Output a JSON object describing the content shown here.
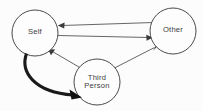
{
  "diagram": {
    "background_color": "#fcfcfc",
    "node_stroke_color": "#4a4a4a",
    "thin_edge_color": "#555555",
    "thick_edge_color": "#1a1a1a",
    "nodes": [
      {
        "id": "self",
        "label": "Self",
        "label_lines": [
          "Self"
        ],
        "cx": 35,
        "cy": 33,
        "r": 23
      },
      {
        "id": "other",
        "label": "Other",
        "label_lines": [
          "Other"
        ],
        "cx": 173,
        "cy": 31,
        "r": 23
      },
      {
        "id": "third_person",
        "label": "Third Person",
        "label_lines": [
          "Third",
          "Person"
        ],
        "cx": 97,
        "cy": 82,
        "r": 23
      }
    ],
    "edges": [
      {
        "id": "other-to-self",
        "from": "other",
        "to": "self",
        "style": "thin",
        "shape": "straight",
        "arrowhead_at": "self"
      },
      {
        "id": "self-to-other",
        "from": "self",
        "to": "other",
        "style": "thin",
        "shape": "straight",
        "arrowhead_at": "other"
      },
      {
        "id": "third-person-to-self",
        "from": "third_person",
        "to": "self",
        "style": "thin",
        "shape": "straight",
        "arrowhead_at": "self"
      },
      {
        "id": "third-person-to-other",
        "from": "third_person",
        "to": "other",
        "style": "thin",
        "shape": "straight",
        "arrowhead_at": "other"
      },
      {
        "id": "self-to-third-person",
        "from": "self",
        "to": "third_person",
        "style": "thick",
        "shape": "curved",
        "arrowhead_at": "third_person"
      }
    ]
  }
}
